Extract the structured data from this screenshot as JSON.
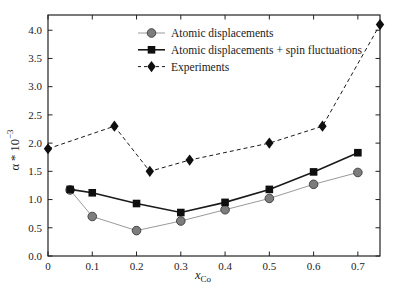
{
  "figure": {
    "background": "#ffffff",
    "xlabel": {
      "base": "x",
      "sub": "Co"
    },
    "ylabel": {
      "base": "α * 10",
      "exp": "−3"
    }
  },
  "chart_data": {
    "type": "line",
    "title": "",
    "xlabel": "x_Co",
    "ylabel": "alpha * 10^-3",
    "xlim": [
      0,
      0.75
    ],
    "ylim": [
      0,
      4.27
    ],
    "xticks": [
      0,
      0.1,
      0.2,
      0.3,
      0.4,
      0.5,
      0.6,
      0.7
    ],
    "yticks": [
      0.0,
      0.5,
      1.0,
      1.5,
      2.0,
      2.5,
      3.0,
      3.5,
      4.0
    ],
    "grid": false,
    "legend_position": "inside-top-left",
    "frame_color": "#222222",
    "series": [
      {
        "name": "Atomic displacements",
        "marker": "circle",
        "marker_color": "#7d7d7d",
        "marker_edge": "#454545",
        "line_color": "#9a9a9a",
        "line_style": "solid",
        "line_width": 1,
        "points": [
          [
            0.05,
            1.17
          ],
          [
            0.1,
            0.7
          ],
          [
            0.2,
            0.45
          ],
          [
            0.3,
            0.62
          ],
          [
            0.4,
            0.82
          ],
          [
            0.5,
            1.02
          ],
          [
            0.6,
            1.27
          ],
          [
            0.7,
            1.48
          ]
        ]
      },
      {
        "name": "Atomic displacements + spin fluctuations",
        "marker": "square",
        "marker_color": "#0f0f0f",
        "marker_edge": "#0f0f0f",
        "line_color": "#1a1a1a",
        "line_style": "solid",
        "line_width": 1.6,
        "points": [
          [
            0.05,
            1.18
          ],
          [
            0.1,
            1.12
          ],
          [
            0.2,
            0.93
          ],
          [
            0.3,
            0.77
          ],
          [
            0.4,
            0.95
          ],
          [
            0.5,
            1.18
          ],
          [
            0.6,
            1.49
          ],
          [
            0.7,
            1.83
          ]
        ]
      },
      {
        "name": "Experiments",
        "marker": "diamond",
        "marker_color": "#0f0f0f",
        "marker_edge": "#0f0f0f",
        "line_color": "#1a1a1a",
        "line_style": "dashed",
        "line_width": 1,
        "points": [
          [
            0,
            1.9
          ],
          [
            0.15,
            2.3
          ],
          [
            0.23,
            1.5
          ],
          [
            0.32,
            1.7
          ],
          [
            0.5,
            2.0
          ],
          [
            0.62,
            2.3
          ],
          [
            0.75,
            4.1
          ]
        ]
      }
    ]
  }
}
